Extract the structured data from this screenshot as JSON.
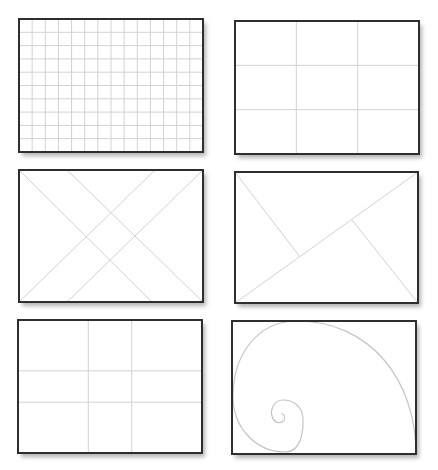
{
  "colors": {
    "background": "#ffffff",
    "frame_border": "#2e2e2e",
    "guide_lines": "#d2d2d2",
    "shadow": "#9a9a9a"
  },
  "panels": [
    {
      "id": "grid",
      "label": "Square grid",
      "frame": {
        "x": 19,
        "y": 19,
        "w": 184,
        "h": 133
      },
      "columns": 14,
      "rows": 10
    },
    {
      "id": "rule-of-thirds",
      "label": "Rule of thirds",
      "frame": {
        "x": 235,
        "y": 21,
        "w": 184,
        "h": 133
      },
      "vertical_fractions": [
        0.3333,
        0.6667
      ],
      "horizontal_fractions": [
        0.3333,
        0.6667
      ]
    },
    {
      "id": "diagonals",
      "label": "Diagonal method",
      "frame": {
        "x": 19,
        "y": 170,
        "w": 184,
        "h": 132
      },
      "lines": [
        [
          [
            19,
            170
          ],
          [
            152,
            302
          ]
        ],
        [
          [
            67,
            170
          ],
          [
            203,
            302
          ]
        ],
        [
          [
            155,
            170
          ],
          [
            19,
            302
          ]
        ],
        [
          [
            203,
            170
          ],
          [
            67,
            302
          ]
        ]
      ]
    },
    {
      "id": "golden-triangles",
      "label": "Golden triangles",
      "frame": {
        "x": 235,
        "y": 172,
        "w": 183,
        "h": 131
      },
      "lines": [
        [
          [
            235,
            303
          ],
          [
            418,
            172
          ]
        ],
        [
          [
            235,
            172
          ],
          [
            300,
            257
          ]
        ],
        [
          [
            418,
            303
          ],
          [
            352,
            220
          ]
        ]
      ]
    },
    {
      "id": "phi-grid",
      "label": "Phi grid",
      "frame": {
        "x": 18,
        "y": 320,
        "w": 184,
        "h": 133
      },
      "vertical_fractions": [
        0.382,
        0.618
      ],
      "horizontal_fractions": [
        0.382,
        0.618
      ]
    },
    {
      "id": "golden-spiral",
      "label": "Golden spiral",
      "frame": {
        "x": 232,
        "y": 321,
        "w": 184,
        "h": 133
      },
      "spiral_path": "M416,454 C416,380 370,321 297,321 C255,321 233,358 233,396 C233,430 258,452 285,452 C305,452 303,420 303,420 C303,406 293,400 283,400 C274,400 270,410 272,416 C274,424 282,424 284,420 C286,416 283,413 281,414"
    }
  ]
}
